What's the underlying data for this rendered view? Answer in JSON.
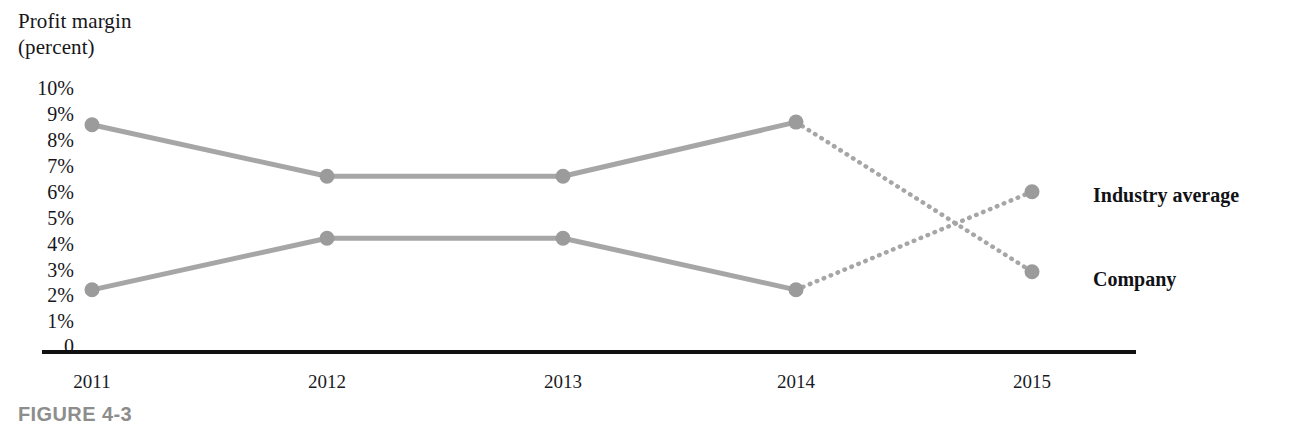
{
  "figure": {
    "caption": "FIGURE 4-3",
    "axis_title": "Profit margin\n(percent)"
  },
  "colors": {
    "line": "#a6a6a6",
    "marker": "#9b9b9b",
    "axis": "#111111",
    "text": "#16171b",
    "caption": "#8d8d8d"
  },
  "chart_data": {
    "type": "line",
    "title": "",
    "xlabel": "",
    "ylabel": "Profit margin (percent)",
    "categories": [
      "2011",
      "2012",
      "2013",
      "2014",
      "2015"
    ],
    "x": [
      2011,
      2012,
      2013,
      2014,
      2015
    ],
    "ylim": [
      0,
      10
    ],
    "ytick_labels": [
      "10%",
      "9%",
      "8%",
      "7%",
      "6%",
      "5%",
      "4%",
      "3%",
      "2%",
      "1%",
      "0"
    ],
    "ytick_values": [
      10,
      9,
      8,
      7,
      6,
      5,
      4,
      3,
      2,
      1,
      0
    ],
    "grid": false,
    "legend_position": "right-inline",
    "series": [
      {
        "name": "Industry average",
        "values": [
          8.5,
          6.5,
          6.5,
          8.6,
          2.8
        ],
        "solid_through_index": 3,
        "dotted_from_index": 3
      },
      {
        "name": "Company",
        "values": [
          2.1,
          4.1,
          4.1,
          2.1,
          5.9
        ],
        "solid_through_index": 3,
        "dotted_from_index": 3
      }
    ],
    "annotations": [
      {
        "text": "Industry average",
        "at_series": 1,
        "at_index": 4
      },
      {
        "text": "Company",
        "at_series": 0,
        "at_index": 4
      }
    ]
  },
  "ytick_positions": [
    86,
    112,
    138,
    164,
    190,
    216,
    242,
    268,
    293,
    319,
    344
  ],
  "xtick_positions": [
    92,
    327,
    563,
    796,
    1032
  ],
  "axis": {
    "x_start": 42,
    "x_end": 1136,
    "y": 352
  }
}
